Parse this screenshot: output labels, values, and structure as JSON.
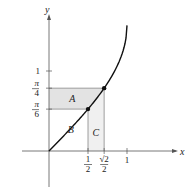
{
  "figure": {
    "type": "area-under-inverse-function",
    "function": "y = arcsin(x)",
    "axes": {
      "x_label": "x",
      "y_label": "y"
    },
    "x_ticks": [
      {
        "value": 0.5,
        "num": "1",
        "den": "2"
      },
      {
        "value": 0.7071,
        "num": "√2",
        "den": "2"
      },
      {
        "value": 1,
        "label": "1"
      }
    ],
    "y_ticks": [
      {
        "value": 0.5236,
        "num": "π",
        "den": "6"
      },
      {
        "value": 0.7854,
        "num": "π",
        "den": "4"
      },
      {
        "value": 1,
        "label": "1"
      }
    ],
    "points": [
      {
        "x": 0.5,
        "y": 0.5236
      },
      {
        "x": 0.7071,
        "y": 0.7854
      }
    ],
    "regions": [
      {
        "name": "A",
        "label": "A",
        "shaded": true
      },
      {
        "name": "B",
        "label": "B",
        "shaded": false
      },
      {
        "name": "C",
        "label": "C",
        "shaded": true
      }
    ],
    "colors": {
      "axis": "#555555",
      "curve": "#111111",
      "shade": "#e3e3e3",
      "guide": "#777777"
    }
  }
}
